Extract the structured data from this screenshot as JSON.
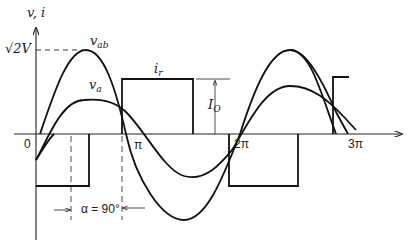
{
  "figure": {
    "axes": {
      "y_label": "v, i",
      "y_tick": "√2V",
      "x_ticks": [
        {
          "label": "0",
          "x": 26
        },
        {
          "label": "π",
          "x": 118
        },
        {
          "label": "2π",
          "x": 227
        },
        {
          "label": "3π",
          "x": 344
        }
      ]
    },
    "curves": {
      "vab_label_main": "v",
      "vab_label_sub": "ab",
      "va_label_main": "v",
      "va_label_sub": "a",
      "ir_label_main": "i",
      "ir_label_sub": "r"
    },
    "annotations": {
      "io_main": "I",
      "io_sub": "O",
      "alpha": "α = 90°"
    }
  }
}
